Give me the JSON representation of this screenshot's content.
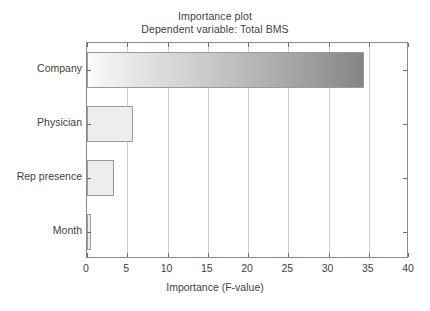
{
  "chart_data": {
    "type": "bar",
    "orientation": "horizontal",
    "title": "Importance plot",
    "subtitle": "Dependent variable: Total BMS",
    "xlabel": "Importance (F-value)",
    "ylabel": "",
    "categories": [
      "Company",
      "Physician",
      "Rep presence",
      "Month"
    ],
    "values": [
      34.4,
      5.7,
      3.4,
      0.5
    ],
    "xlim": [
      0,
      40
    ],
    "xticks": [
      0,
      5,
      10,
      15,
      20,
      25,
      30,
      35,
      40
    ],
    "xticklabels": [
      "0",
      "5",
      "10",
      "15",
      "20",
      "25",
      "30",
      "35",
      "40"
    ],
    "grid": "vertical",
    "legend": "none",
    "bar_styles": [
      {
        "category": "Company",
        "fill": "gradient",
        "fill_from": "#fbfbfb",
        "fill_to": "#848484",
        "border": "#9a9a9a"
      },
      {
        "category": "Physician",
        "fill": "solid",
        "fill_from": "#ededed",
        "fill_to": "#ededed",
        "border": "#9a9a9a"
      },
      {
        "category": "Rep presence",
        "fill": "solid",
        "fill_from": "#ededed",
        "fill_to": "#ededed",
        "border": "#9a9a9a"
      },
      {
        "category": "Month",
        "fill": "solid",
        "fill_from": "#ededed",
        "fill_to": "#ededed",
        "border": "#9a9a9a"
      }
    ]
  },
  "colors": {
    "background": "#ffffff",
    "frame": "#8a8a8a",
    "gridline": "#cfcfcf",
    "tick": "#6d6d6d",
    "text": "#3f3f3f"
  }
}
